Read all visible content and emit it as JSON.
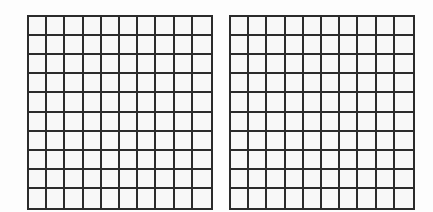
{
  "diagram": {
    "type": "grid-pair",
    "grids": [
      {
        "name": "left-grid",
        "rows": 10,
        "cols": 10,
        "shaded_cells": 0,
        "line_color": "#2b2b2b",
        "fill_color": "#f8f8f8"
      },
      {
        "name": "right-grid",
        "rows": 10,
        "cols": 10,
        "shaded_cells": 0,
        "line_color": "#2b2b2b",
        "fill_color": "#f8f8f8"
      }
    ],
    "background_color": "#fdfdfd"
  }
}
